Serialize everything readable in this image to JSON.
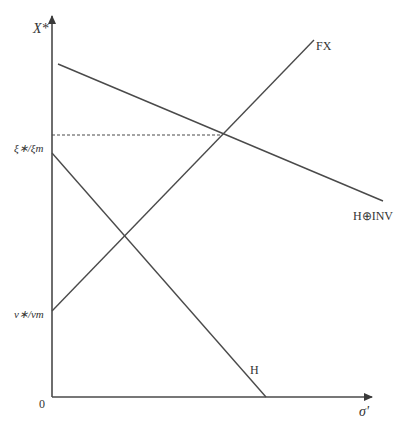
{
  "diagram": {
    "axes": {
      "y_label": "X*",
      "x_label": "σ'",
      "origin_label": "0"
    },
    "y_ticks": [
      {
        "label": "ξ∗/ξm",
        "y": 135
      },
      {
        "label": "ν∗/νm",
        "y": 311
      }
    ],
    "lines": [
      {
        "name": "FX",
        "label": "FX",
        "from": [
          52,
          311
        ],
        "to": [
          314,
          40
        ]
      },
      {
        "name": "H⊕INV",
        "label": "H⊕INV",
        "from": [
          58,
          64
        ],
        "to": [
          383,
          201
        ]
      },
      {
        "name": "H",
        "label": "H",
        "from": [
          52,
          153
        ],
        "to": [
          266,
          397
        ]
      }
    ],
    "reference_line": {
      "style": "dashed",
      "from": [
        52,
        135
      ],
      "to": [
        222,
        135
      ]
    },
    "colors": {
      "line": "#4a4a4a",
      "text": "#333333",
      "background": "#ffffff"
    }
  }
}
